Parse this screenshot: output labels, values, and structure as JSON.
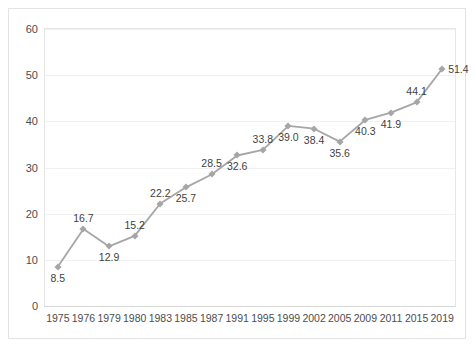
{
  "chart_data": {
    "type": "line",
    "title": "",
    "xlabel": "",
    "ylabel": "",
    "ylim": [
      0,
      60
    ],
    "ytick_step": 10,
    "grid": true,
    "legend": false,
    "line_color": "#a6a6a6",
    "marker": "diamond",
    "categories": [
      "1975",
      "1976",
      "1979",
      "1980",
      "1983",
      "1985",
      "1987",
      "1991",
      "1995",
      "1999",
      "2002",
      "2005",
      "2009",
      "2011",
      "2015",
      "2019"
    ],
    "values": [
      8.5,
      16.7,
      12.9,
      15.2,
      22.2,
      25.7,
      28.5,
      32.6,
      33.8,
      39.0,
      38.4,
      35.6,
      40.3,
      41.9,
      44.1,
      51.4
    ],
    "value_labels": [
      "8.5",
      "16.7",
      "12.9",
      "15.2",
      "22.2",
      "25.7",
      "28.5",
      "32.6",
      "33.8",
      "39.0",
      "38.4",
      "35.6",
      "40.3",
      "41.9",
      "44.1",
      "51.4"
    ],
    "label_positions": [
      "below",
      "above",
      "below",
      "above",
      "above",
      "below",
      "above",
      "below",
      "above",
      "below",
      "below",
      "below",
      "below",
      "below",
      "above",
      "right"
    ],
    "yticks": [
      "0",
      "10",
      "20",
      "30",
      "40",
      "50",
      "60"
    ]
  }
}
